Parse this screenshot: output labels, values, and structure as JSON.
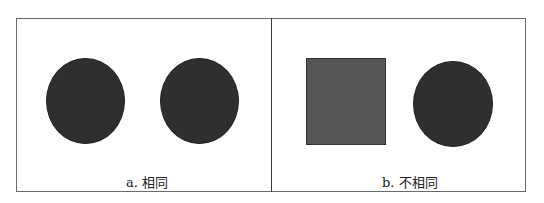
{
  "panels": [
    {
      "id": "a",
      "caption": "a. 相同",
      "shapes": [
        {
          "type": "circle",
          "color": "#2f2f2f"
        },
        {
          "type": "circle",
          "color": "#2f2f2f"
        }
      ]
    },
    {
      "id": "b",
      "caption": "b. 不相同",
      "shapes": [
        {
          "type": "square",
          "color": "#565656"
        },
        {
          "type": "circle",
          "color": "#2f2f2f"
        }
      ]
    }
  ]
}
